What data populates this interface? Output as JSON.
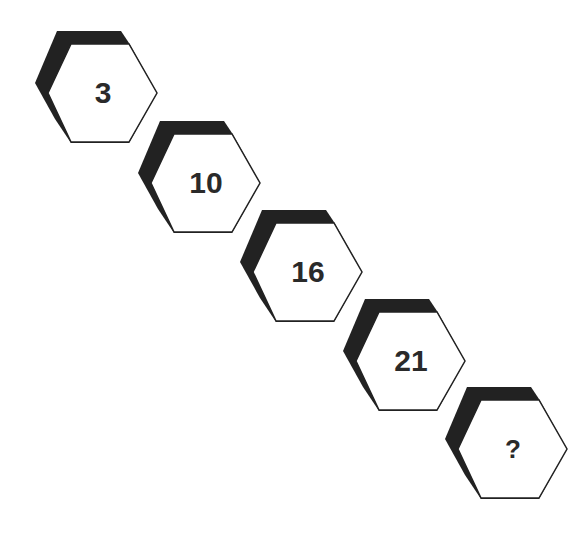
{
  "colors": {
    "shadow": "#222222",
    "face": "#ffffff",
    "outline": "#222222",
    "text": "#2a2a2a"
  },
  "hexagons": [
    {
      "label": "3",
      "left": 47,
      "top": 43
    },
    {
      "label": "10",
      "left": 150,
      "top": 133
    },
    {
      "label": "16",
      "left": 252,
      "top": 222
    },
    {
      "label": "21",
      "left": 355,
      "top": 311
    },
    {
      "label": "?",
      "left": 457,
      "top": 399
    }
  ]
}
